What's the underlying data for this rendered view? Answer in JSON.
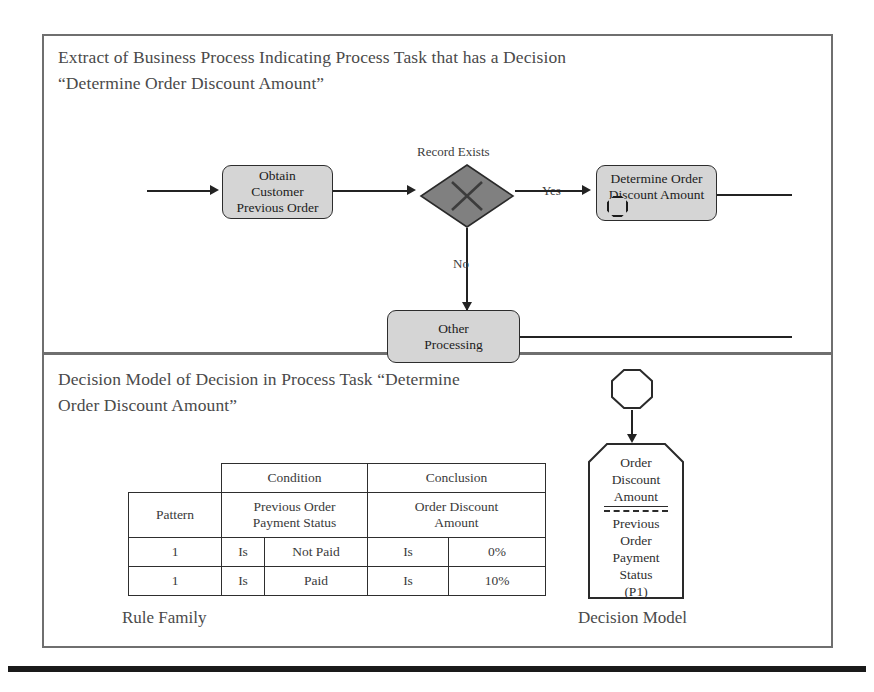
{
  "figure": {
    "top_panel": {
      "title": "Extract of Business Process Indicating Process Task that has a Decision\n“Determine Order Discount Amount”",
      "tasks": {
        "obtain": "Obtain\nCustomer\nPrevious Order",
        "determine": "Determine Order\nDiscount Amount",
        "other": "Other\nProcessing"
      },
      "gateway": {
        "label": "Record Exists",
        "symbol": "X",
        "type": "exclusive-gateway"
      },
      "flow_labels": {
        "yes": "Yes",
        "no": "No"
      },
      "decision_marker": "octagon"
    },
    "bottom_panel": {
      "title": "Decision Model of Decision in Process Task “Determine\nOrder Discount Amount”",
      "rule_family": {
        "group_headers": [
          "Condition",
          "Conclusion"
        ],
        "column_headers": [
          "Pattern",
          "Previous Order\nPayment Status",
          "Order Discount\nAmount"
        ],
        "rows": [
          {
            "pattern": "1",
            "cond_op": "Is",
            "cond_value": "Not Paid",
            "concl_op": "Is",
            "concl_value": "0%"
          },
          {
            "pattern": "1",
            "cond_op": "Is",
            "cond_value": "Paid",
            "concl_op": "Is",
            "concl_value": "10%"
          }
        ]
      },
      "decision_model": {
        "conclusion": "Order\nDiscount\nAmount",
        "condition": "Previous\nOrder\nPayment\nStatus\n(P1)"
      },
      "captions": {
        "rule_family": "Rule Family",
        "decision_model": "Decision Model"
      }
    }
  },
  "colors": {
    "frame": "#6f6f6f",
    "task_fill": "#d5d5d5",
    "gateway_fill": "#808080",
    "stroke": "#232323",
    "text": "#3a3a3a"
  }
}
